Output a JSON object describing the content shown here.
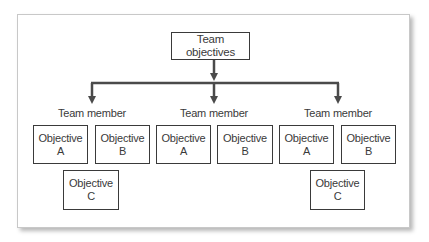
{
  "diagram": {
    "type": "hierarchy",
    "root": {
      "label": "Team objectives"
    },
    "members": [
      {
        "label": "Team member",
        "objectives": [
          {
            "line1": "Objective",
            "line2": "A"
          },
          {
            "line1": "Objective",
            "line2": "B"
          },
          {
            "line1": "Objective",
            "line2": "C"
          }
        ]
      },
      {
        "label": "Team member",
        "objectives": [
          {
            "line1": "Objective",
            "line2": "A"
          },
          {
            "line1": "Objective",
            "line2": "B"
          }
        ]
      },
      {
        "label": "Team member",
        "objectives": [
          {
            "line1": "Objective",
            "line2": "A"
          },
          {
            "line1": "Objective",
            "line2": "B"
          },
          {
            "line1": "Objective",
            "line2": "C"
          }
        ]
      }
    ],
    "colors": {
      "line": "#4a4a4a",
      "box_border": "#3a3a3a",
      "frame_border": "#c8c8c8"
    }
  }
}
